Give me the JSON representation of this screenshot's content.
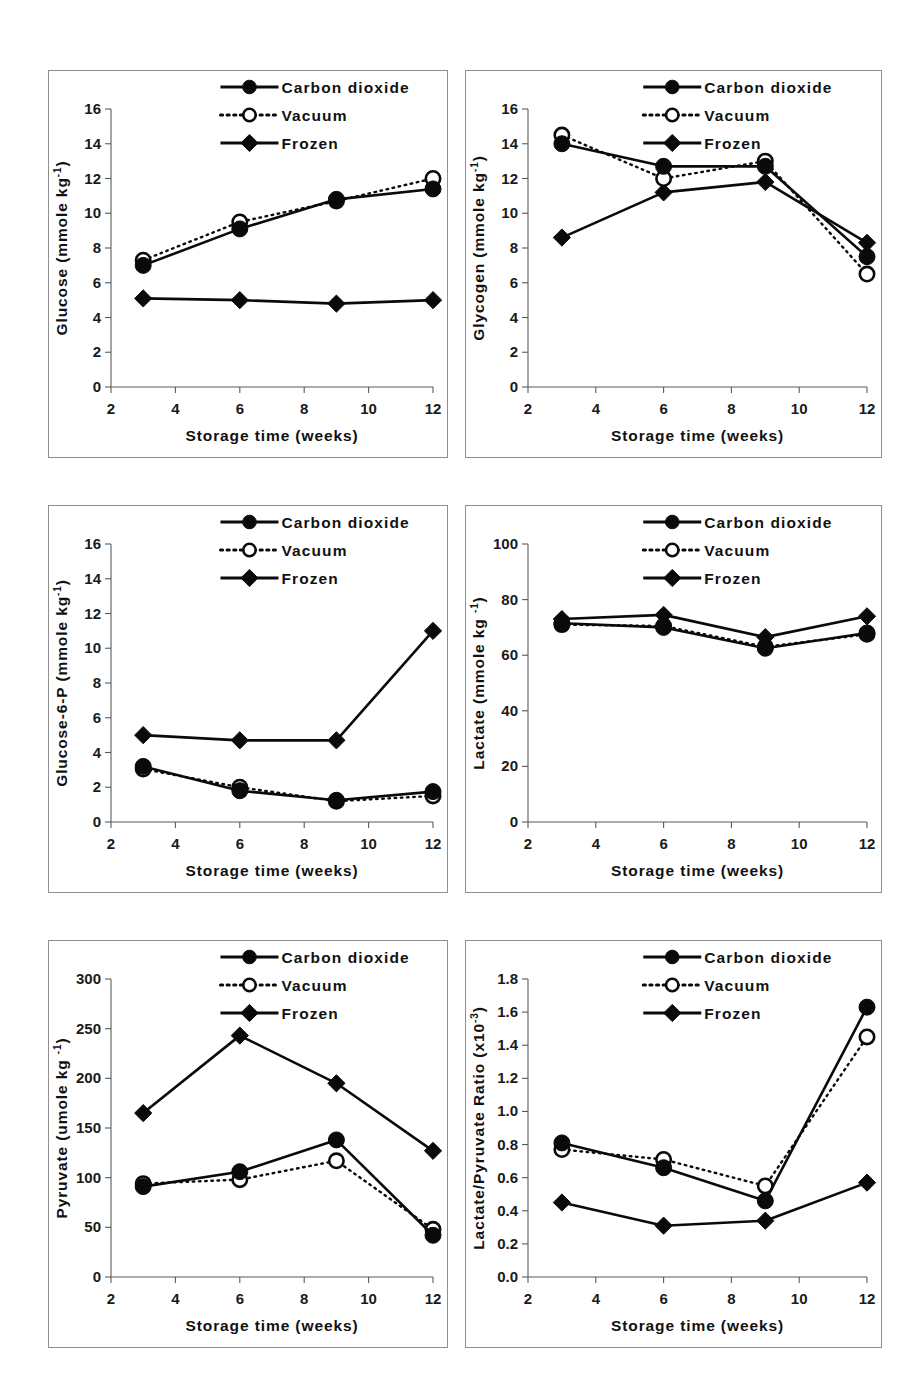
{
  "figure": {
    "panel_count": 6,
    "x_axis_title": "Storage time (weeks)",
    "x_ticks": [
      "2",
      "4",
      "6",
      "8",
      "10",
      "12"
    ],
    "legend": [
      {
        "label": "Carbon dioxide",
        "marker": "filled-circle-icon",
        "line": "solid"
      },
      {
        "label": "Vacuum",
        "marker": "open-circle-icon",
        "line": "dotted"
      },
      {
        "label": "Frozen",
        "marker": "filled-diamond-icon",
        "line": "solid"
      }
    ],
    "colors": {
      "ink": "#0a0a0a",
      "axis": "#5a5a5a",
      "panel_border": "#8f8f8f",
      "background": "#ffffff"
    }
  },
  "chart_data": [
    {
      "type": "line",
      "title": "",
      "panel": "glucose",
      "xlabel": "Storage time (weeks)",
      "ylabel": "Glucose (mmole kg",
      "ylabel_sup": "-1",
      "ylabel_suffix": ")",
      "x": [
        3,
        6,
        9,
        12
      ],
      "xlim": [
        2,
        12
      ],
      "xticks": [
        2,
        4,
        6,
        8,
        10,
        12
      ],
      "ylim": [
        0,
        16
      ],
      "yticks": [
        0,
        2,
        4,
        6,
        8,
        10,
        12,
        14,
        16
      ],
      "ytick_labels": [
        "0",
        "2",
        "4",
        "6",
        "8",
        "10",
        "12",
        "14",
        "16"
      ],
      "grid": false,
      "legend_position": "top-center",
      "series": [
        {
          "name": "Carbon dioxide",
          "values": [
            7.0,
            9.1,
            10.8,
            11.4
          ]
        },
        {
          "name": "Vacuum",
          "values": [
            7.3,
            9.5,
            10.7,
            12.0
          ]
        },
        {
          "name": "Frozen",
          "values": [
            5.1,
            5.0,
            4.8,
            5.0
          ]
        }
      ]
    },
    {
      "type": "line",
      "title": "",
      "panel": "glycogen",
      "xlabel": "Storage time (weeks)",
      "ylabel": "Glycogen (mmole kg",
      "ylabel_sup": "-1",
      "ylabel_suffix": ")",
      "x": [
        3,
        6,
        9,
        12
      ],
      "xlim": [
        2,
        12
      ],
      "xticks": [
        2,
        4,
        6,
        8,
        10,
        12
      ],
      "ylim": [
        0,
        16
      ],
      "yticks": [
        0,
        2,
        4,
        6,
        8,
        10,
        12,
        14,
        16
      ],
      "ytick_labels": [
        "0",
        "2",
        "4",
        "6",
        "8",
        "10",
        "12",
        "14",
        "16"
      ],
      "grid": false,
      "legend_position": "top-center",
      "series": [
        {
          "name": "Carbon dioxide",
          "values": [
            14.0,
            12.7,
            12.7,
            7.5
          ]
        },
        {
          "name": "Vacuum",
          "values": [
            14.5,
            12.0,
            13.0,
            6.5
          ]
        },
        {
          "name": "Frozen",
          "values": [
            8.6,
            11.2,
            11.8,
            8.3
          ]
        }
      ]
    },
    {
      "type": "line",
      "title": "",
      "panel": "glucose-6-p",
      "xlabel": "Storage time (weeks)",
      "ylabel": "Glucose-6-P (mmole kg",
      "ylabel_sup": "-1",
      "ylabel_suffix": ")",
      "x": [
        3,
        6,
        9,
        12
      ],
      "xlim": [
        2,
        12
      ],
      "xticks": [
        2,
        4,
        6,
        8,
        10,
        12
      ],
      "ylim": [
        0,
        16
      ],
      "yticks": [
        0,
        2,
        4,
        6,
        8,
        10,
        12,
        14,
        16
      ],
      "ytick_labels": [
        "0",
        "2",
        "4",
        "6",
        "8",
        "10",
        "12",
        "14",
        "16"
      ],
      "grid": false,
      "legend_position": "top-center",
      "series": [
        {
          "name": "Carbon dioxide",
          "values": [
            3.2,
            1.8,
            1.25,
            1.75
          ]
        },
        {
          "name": "Vacuum",
          "values": [
            3.05,
            2.0,
            1.2,
            1.5
          ]
        },
        {
          "name": "Frozen",
          "values": [
            5.0,
            4.7,
            4.7,
            11.0
          ]
        }
      ]
    },
    {
      "type": "line",
      "title": "",
      "panel": "lactate",
      "xlabel": "Storage time (weeks)",
      "ylabel": "Lactate (mmole kg ",
      "ylabel_sup": "-1",
      "ylabel_suffix": ")",
      "x": [
        3,
        6,
        9,
        12
      ],
      "xlim": [
        2,
        12
      ],
      "xticks": [
        2,
        4,
        6,
        8,
        10,
        12
      ],
      "ylim": [
        0,
        100
      ],
      "yticks": [
        0,
        20,
        40,
        60,
        80,
        100
      ],
      "ytick_labels": [
        "0",
        "20",
        "40",
        "60",
        "80",
        "100"
      ],
      "grid": false,
      "legend_position": "top-center",
      "series": [
        {
          "name": "Carbon dioxide",
          "values": [
            71.5,
            70.0,
            62.5,
            68.0
          ]
        },
        {
          "name": "Vacuum",
          "values": [
            71.0,
            70.5,
            63.0,
            67.5
          ]
        },
        {
          "name": "Frozen",
          "values": [
            73.0,
            74.5,
            66.5,
            74.0
          ]
        }
      ]
    },
    {
      "type": "line",
      "title": "",
      "panel": "pyruvate",
      "xlabel": "Storage time (weeks)",
      "ylabel": "Pyruvate (umole kg ",
      "ylabel_sup": "-1",
      "ylabel_suffix": ")",
      "x": [
        3,
        6,
        9,
        12
      ],
      "xlim": [
        2,
        12
      ],
      "xticks": [
        2,
        4,
        6,
        8,
        10,
        12
      ],
      "ylim": [
        0,
        300
      ],
      "yticks": [
        0,
        50,
        100,
        150,
        200,
        250,
        300
      ],
      "ytick_labels": [
        "0",
        "50",
        "100",
        "150",
        "200",
        "250",
        "300"
      ],
      "grid": false,
      "legend_position": "top-center",
      "series": [
        {
          "name": "Carbon dioxide",
          "values": [
            91,
            106,
            138,
            42
          ]
        },
        {
          "name": "Vacuum",
          "values": [
            94,
            98,
            117,
            48
          ]
        },
        {
          "name": "Frozen",
          "values": [
            165,
            243,
            195,
            127
          ]
        }
      ]
    },
    {
      "type": "line",
      "title": "",
      "panel": "lactate-pyruvate-ratio",
      "xlabel": "Storage time (weeks)",
      "ylabel": "Lactate/Pyruvate Ratio (x10",
      "ylabel_sup": "-3",
      "ylabel_suffix": ")",
      "x": [
        3,
        6,
        9,
        12
      ],
      "xlim": [
        2,
        12
      ],
      "xticks": [
        2,
        4,
        6,
        8,
        10,
        12
      ],
      "ylim": [
        0.0,
        1.8
      ],
      "yticks": [
        0.0,
        0.2,
        0.4,
        0.6,
        0.8,
        1.0,
        1.2,
        1.4,
        1.6,
        1.8
      ],
      "ytick_labels": [
        "0.0",
        "0.2",
        "0.4",
        "0.6",
        "0.8",
        "1.0",
        "1.2",
        "1.4",
        "1.6",
        "1.8"
      ],
      "grid": false,
      "legend_position": "top-center",
      "series": [
        {
          "name": "Carbon dioxide",
          "values": [
            0.81,
            0.66,
            0.46,
            1.63
          ]
        },
        {
          "name": "Vacuum",
          "values": [
            0.77,
            0.71,
            0.55,
            1.45
          ]
        },
        {
          "name": "Frozen",
          "values": [
            0.45,
            0.31,
            0.34,
            0.57
          ]
        }
      ]
    }
  ]
}
